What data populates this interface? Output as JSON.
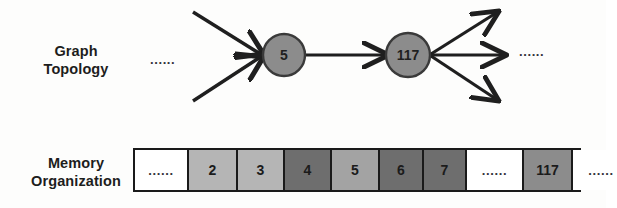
{
  "diagram": {
    "rows": [
      {
        "id": "graph",
        "label": "Graph\nTopology"
      },
      {
        "id": "memory",
        "label": "Memory\nOrganization"
      }
    ]
  },
  "labels": {
    "graph_topology_line1": "Graph",
    "graph_topology_line2": "Topology",
    "memory_organization_line1": "Memory",
    "memory_organization_line2": "Organization"
  },
  "graph": {
    "ellipsis_left": "......",
    "ellipsis_right": "......",
    "nodes": [
      {
        "id": "node-5",
        "label": "5",
        "cx": 284,
        "cy": 55,
        "r": 21,
        "fill": "#8c8c8c"
      },
      {
        "id": "node-117",
        "label": "117",
        "cx": 408,
        "cy": 55,
        "r": 22,
        "fill": "#8c8c8c"
      }
    ],
    "incoming_edges": [
      {
        "from": "upper-left",
        "x1": 193,
        "y1": 12,
        "x2": 263,
        "y2": 55
      },
      {
        "from": "lower-left",
        "x1": 193,
        "y1": 101,
        "x2": 263,
        "y2": 55
      }
    ],
    "middle_edge": {
      "from": "node-5",
      "to": "node-117",
      "x1": 305,
      "y1": 55,
      "x2": 386,
      "y2": 55
    },
    "outgoing_edges": [
      {
        "to": "up-right",
        "x1": 430,
        "y1": 55,
        "x2": 497,
        "y2": 12
      },
      {
        "to": "right",
        "x1": 430,
        "y1": 55,
        "x2": 505,
        "y2": 55
      },
      {
        "to": "down-right",
        "x1": 430,
        "y1": 55,
        "x2": 497,
        "y2": 101
      }
    ],
    "edge_color": "#1f1f1f",
    "node_stroke": "#3a3a3a"
  },
  "memory": {
    "cells": [
      {
        "value": "......",
        "shade": "#ffffff",
        "width": 54,
        "is_dots": true
      },
      {
        "value": "2",
        "shade": "#b5b5b5",
        "width": 49,
        "is_dots": false
      },
      {
        "value": "3",
        "shade": "#b5b5b5",
        "width": 47,
        "is_dots": false
      },
      {
        "value": "4",
        "shade": "#6e6e6e",
        "width": 47,
        "is_dots": false
      },
      {
        "value": "5",
        "shade": "#a3a3a3",
        "width": 48,
        "is_dots": false
      },
      {
        "value": "6",
        "shade": "#6e6e6e",
        "width": 44,
        "is_dots": false
      },
      {
        "value": "7",
        "shade": "#6e6e6e",
        "width": 43,
        "is_dots": false
      },
      {
        "value": "......",
        "shade": "#ffffff",
        "width": 57,
        "is_dots": true
      },
      {
        "value": "117",
        "shade": "#8c8c8c",
        "width": 49,
        "is_dots": false
      },
      {
        "value": "......",
        "shade": "#ffffff",
        "width": 56,
        "is_dots": true
      }
    ],
    "border_color": "#1a1a1a"
  }
}
